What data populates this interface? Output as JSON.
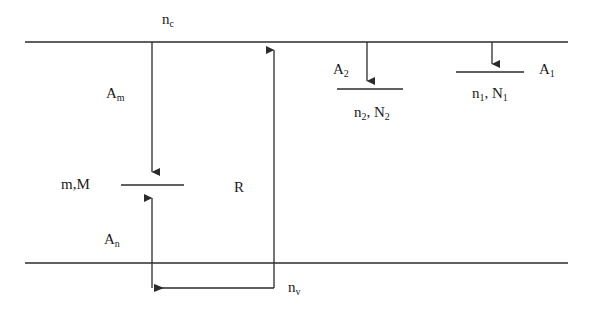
{
  "figure": {
    "type": "energy-level-transition-diagram",
    "width": 590,
    "height": 314,
    "background_color": "#ffffff",
    "line_color": "#2b2b2b",
    "text_color": "#1a1a1a"
  },
  "labels": {
    "nc": "n",
    "nc_sub": "c",
    "Am": "A",
    "Am_sub": "m",
    "An": "A",
    "An_sub": "n",
    "mM": "m,M",
    "R": "R",
    "nv": "n",
    "nv_sub": "v",
    "A2": "A",
    "A2_sub": "2",
    "n2N2": "n",
    "n2N2_sub1": "2",
    "n2N2_mid": ", N",
    "n2N2_sub2": "2",
    "A1": "A",
    "A1_sub": "1",
    "n1N1": "n",
    "n1N1_sub1": "1",
    "n1N1_mid": ", N",
    "n1N1_sub2": "1"
  },
  "geometry": {
    "continuum_line": {
      "x1": 25,
      "y1": 42,
      "x2": 568,
      "y2": 42
    },
    "ground_line": {
      "x1": 25,
      "y1": 263,
      "x2": 568,
      "y2": 263
    },
    "level_mM": {
      "x1": 121,
      "y1": 185,
      "x2": 184,
      "y2": 185
    },
    "level_n2": {
      "x1": 337,
      "y1": 89,
      "x2": 403,
      "y2": 89
    },
    "level_n1": {
      "x1": 456,
      "y1": 72,
      "x2": 524,
      "y2": 72
    },
    "arrow_Am": {
      "x": 152,
      "y1": 42,
      "y2": 180,
      "direction": "down"
    },
    "arrow_An": {
      "x": 152,
      "y1": 288,
      "y2": 190,
      "direction": "up"
    },
    "arrow_R_vertical": {
      "x": 274,
      "y1": 288,
      "y2": 42,
      "direction": "up"
    },
    "arrow_R_horizontal": {
      "x1": 274,
      "x2": 152,
      "y": 288,
      "direction": "left"
    },
    "arrow_A2": {
      "x": 367,
      "y1": 42,
      "y2": 87,
      "direction": "down"
    },
    "arrow_A1": {
      "x": 492,
      "y1": 42,
      "y2": 70,
      "direction": "down"
    }
  }
}
